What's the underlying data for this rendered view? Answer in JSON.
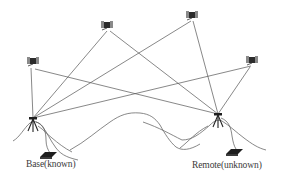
{
  "diagram": {
    "type": "GPS relative positioning (baseline) diagram",
    "colors": {
      "line": "#555555",
      "terrain": "#666666",
      "satellite": "#333333",
      "tripod": "#222222",
      "receiver": "#1e1e1e",
      "label": "#3a3a3a"
    },
    "satellites": [
      {
        "id": "sat-1",
        "icon": "satellite-icon",
        "x": 33,
        "y": 63
      },
      {
        "id": "sat-2",
        "icon": "satellite-icon",
        "x": 107,
        "y": 27
      },
      {
        "id": "sat-3",
        "icon": "satellite-icon",
        "x": 192,
        "y": 17
      },
      {
        "id": "sat-4",
        "icon": "satellite-icon",
        "x": 252,
        "y": 62
      }
    ],
    "stations": [
      {
        "id": "base",
        "label": "Base(known)",
        "icon": "tripod-antenna-icon",
        "x": 33,
        "y": 118,
        "receiver_icon": "gps-receiver-icon"
      },
      {
        "id": "remote",
        "label": "Remote(unknown)",
        "icon": "tripod-antenna-icon",
        "x": 218,
        "y": 114,
        "receiver_icon": "gps-receiver-icon"
      }
    ],
    "signal_lines": "each satellite connects to both base and remote stations"
  }
}
